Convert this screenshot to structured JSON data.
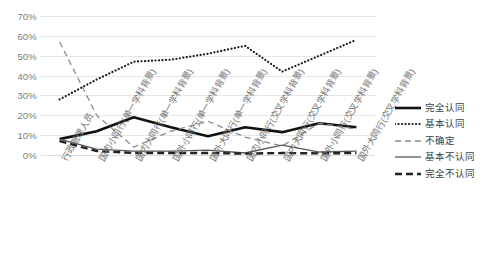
{
  "chart_data": {
    "type": "line",
    "title": "",
    "xlabel": "",
    "ylabel": "",
    "ylim": [
      0,
      70
    ],
    "ytick_labels": [
      "70%",
      "60%",
      "50%",
      "40%",
      "30%",
      "20%",
      "10%",
      "0%"
    ],
    "ytick_values": [
      70,
      60,
      50,
      40,
      30,
      20,
      10,
      0
    ],
    "grid": "horizontal",
    "legend_position": "right",
    "categories": [
      "行政管理人员",
      "国内小同行(单一学科背景)",
      "国内大同行(单一学科背景)",
      "国外小同行(单一学科背景)",
      "国外大同行(单一学科背景)",
      "国内小同行(交叉学科背景)",
      "国内大同行(交叉学科背景)",
      "国外小同行(交叉学科背景)",
      "国外大同行(交叉学科背景)"
    ],
    "series": [
      {
        "name": "完全认同",
        "style": "thick-solid",
        "color": "#111111",
        "values": [
          8,
          12,
          19,
          14,
          9.5,
          14,
          11.5,
          16,
          14
        ]
      },
      {
        "name": "基本认同",
        "style": "dotted",
        "color": "#1a1a1a",
        "values": [
          28,
          38,
          47,
          48,
          51,
          55,
          42,
          50,
          58
        ]
      },
      {
        "name": "不确定",
        "style": "dashed",
        "color": "#8c8c8c",
        "values": [
          57,
          20,
          4,
          12,
          17,
          9,
          4.5,
          16,
          13
        ]
      },
      {
        "name": "基本不认同",
        "style": "thin-solid",
        "color": "#5a5a5a",
        "values": [
          8,
          3,
          2,
          2,
          2.5,
          1,
          5,
          1.5,
          2
        ]
      },
      {
        "name": "完全不认同",
        "style": "thick-dashed",
        "color": "#222222",
        "values": [
          7,
          2,
          1,
          1,
          1,
          0.7,
          1,
          0.8,
          1
        ]
      }
    ]
  },
  "legend": {
    "items": [
      {
        "label": "完全认同"
      },
      {
        "label": "基本认同"
      },
      {
        "label": "不确定"
      },
      {
        "label": "基本不认同"
      },
      {
        "label": "完全不认同"
      }
    ]
  }
}
